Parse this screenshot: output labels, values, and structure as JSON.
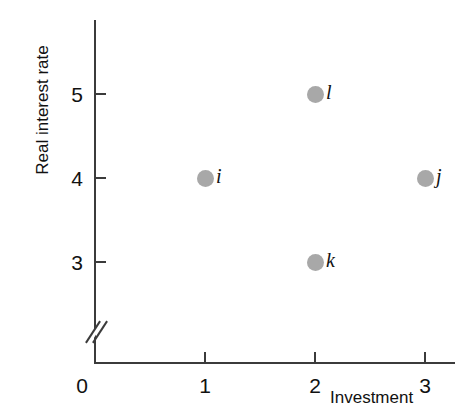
{
  "chart_data": {
    "type": "scatter",
    "title": "",
    "xlabel": "Investment",
    "ylabel": "Real interest rate",
    "xlim": [
      0,
      3.3
    ],
    "ylim": [
      2.6,
      5.6
    ],
    "grid": false,
    "legend": null,
    "axis_break": {
      "axis": "y",
      "symbol": "//",
      "note": "y-axis broken between 0 and 3"
    },
    "origin_label": "0",
    "xticks": [
      1,
      2,
      3
    ],
    "xticklabels": [
      "1",
      "2",
      "3"
    ],
    "yticks": [
      3,
      4,
      5
    ],
    "yticklabels": [
      "3",
      "4",
      "5"
    ],
    "marker_color": "#a8a8a8",
    "axis_color": "#3b3b3b",
    "points": [
      {
        "label": "i",
        "x": 1,
        "y": 4
      },
      {
        "label": "l",
        "x": 2,
        "y": 5
      },
      {
        "label": "k",
        "x": 2,
        "y": 3
      },
      {
        "label": "j",
        "x": 3,
        "y": 4
      }
    ]
  }
}
